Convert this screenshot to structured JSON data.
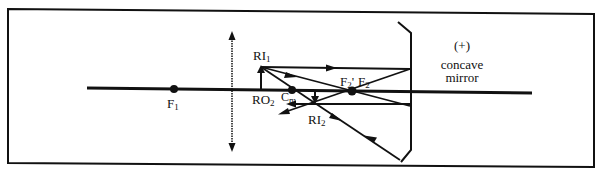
{
  "figure": {
    "type": "ray-diagram",
    "colors": {
      "ink": "#111111",
      "background": "#ffffff"
    }
  },
  "labels": {
    "f1": {
      "main": "F",
      "sub": "1"
    },
    "ri1": {
      "main": "RI",
      "sub": "1"
    },
    "ro2": {
      "main": "RO",
      "sub": "2"
    },
    "cm": {
      "main": "C",
      "sub": "m"
    },
    "f2prime": {
      "main": "F",
      "sub": "2",
      "suffix": "'"
    },
    "f2": {
      "main": "F",
      "sub": "2"
    },
    "ri2": {
      "main": "RI",
      "sub": "2"
    },
    "mirror_sign": "(+)",
    "mirror_name_line1": "concave",
    "mirror_name_line2": "mirror"
  },
  "elements": {
    "optical_axis": "principal axis",
    "lens": "converging lens",
    "mirror": "concave mirror"
  }
}
